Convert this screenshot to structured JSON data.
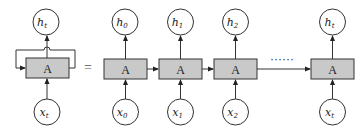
{
  "diagram": {
    "type": "rnn-unrolled",
    "colors": {
      "box_fill": "#c9c9c9",
      "stroke": "#333333",
      "background": "#ffffff"
    },
    "folded": {
      "cell_label": "A",
      "output": {
        "base": "h",
        "sub": "t"
      },
      "input": {
        "base": "x",
        "sub": "t"
      }
    },
    "equals": "=",
    "unrolled": [
      {
        "cell_label": "A",
        "output": {
          "base": "h",
          "sub": "0"
        },
        "input": {
          "base": "x",
          "sub": "0"
        }
      },
      {
        "cell_label": "A",
        "output": {
          "base": "h",
          "sub": "1"
        },
        "input": {
          "base": "x",
          "sub": "1"
        }
      },
      {
        "cell_label": "A",
        "output": {
          "base": "h",
          "sub": "2"
        },
        "input": {
          "base": "x",
          "sub": "2"
        }
      },
      {
        "cell_label": "A",
        "output": {
          "base": "h",
          "sub": "t"
        },
        "input": {
          "base": "x",
          "sub": "t"
        }
      }
    ],
    "ellipsis": "······"
  }
}
